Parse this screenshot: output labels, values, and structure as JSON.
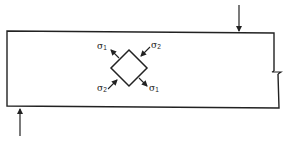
{
  "diagram": {
    "type": "beam-stress-element",
    "stroke_color": "#222222",
    "background": "#ffffff",
    "beam": {
      "shape": "rectangle-with-break",
      "break_symbol": "right-edge"
    },
    "loads": [
      {
        "id": "top-load",
        "direction": "down"
      },
      {
        "id": "bottom-support-reaction",
        "direction": "up"
      }
    ],
    "stress_element": {
      "shape": "square-rotated-45",
      "labels": {
        "top_left": {
          "sym": "σ",
          "sub": "1"
        },
        "top_right": {
          "sym": "σ",
          "sub": "2"
        },
        "bottom_left": {
          "sym": "σ",
          "sub": "2"
        },
        "bottom_right": {
          "sym": "σ",
          "sub": "1"
        }
      }
    }
  }
}
